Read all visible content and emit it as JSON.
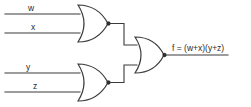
{
  "diagram": {
    "type": "logic-gate-diagram",
    "line_color": "#3b3b3b",
    "background": "#ffffff",
    "inputs": [
      {
        "name": "w",
        "label": "w",
        "y": 14
      },
      {
        "name": "x",
        "label": "x",
        "y": 33
      },
      {
        "name": "y",
        "label": "y",
        "y": 73
      },
      {
        "name": "z",
        "label": "z",
        "y": 92
      }
    ],
    "gates": [
      {
        "id": "or1",
        "kind": "OR",
        "inputs": [
          "w",
          "x"
        ],
        "output_label": "w+x"
      },
      {
        "id": "or2",
        "kind": "OR",
        "inputs": [
          "y",
          "z"
        ],
        "output_label": "y+z"
      },
      {
        "id": "and1",
        "kind": "AND",
        "inputs": [
          "or1",
          "or2"
        ],
        "output_label": "f"
      }
    ],
    "output": {
      "name": "f",
      "expression": "f = (w+x)(y+z)"
    }
  }
}
